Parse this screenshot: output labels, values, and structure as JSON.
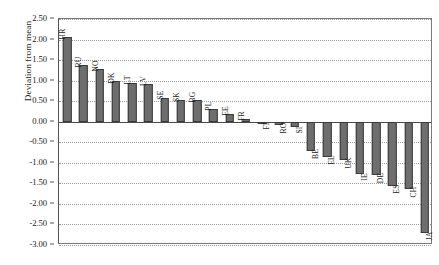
{
  "chart_data": {
    "type": "bar",
    "title": "",
    "xlabel": "",
    "ylabel": "Deviation from mean",
    "ylim": [
      -3.0,
      2.5
    ],
    "grid": true,
    "legend": "none",
    "orientation": "vertical",
    "bar_color": "#6e6e6e",
    "bar_edge_color": "#3a3a3a",
    "y_ticks": [
      "2.50",
      "2.00",
      "1.50",
      "1.00",
      "0.50",
      "0.00",
      "-0.50",
      "-1.00",
      "-1.50",
      "-2.00",
      "-2.50",
      "-3.00"
    ],
    "y_tick_values": [
      2.5,
      2.0,
      1.5,
      1.0,
      0.5,
      0.0,
      -0.5,
      -1.0,
      -1.5,
      -2.0,
      -2.5,
      -3.0
    ],
    "categories": [
      "HR",
      "RU",
      "NO",
      "DK",
      "LT",
      "LV",
      "SE",
      "SK",
      "BG",
      "PL",
      "EE",
      "FR",
      "FI",
      "RO",
      "SI",
      "BE",
      "EL",
      "UK",
      "IE",
      "DE",
      "ES",
      "CH",
      "JA"
    ],
    "values": [
      2.07,
      1.37,
      1.28,
      1.0,
      0.95,
      0.92,
      0.58,
      0.53,
      0.52,
      0.32,
      0.2,
      0.06,
      -0.02,
      -0.09,
      -0.12,
      -0.72,
      -0.87,
      -0.93,
      -1.28,
      -1.3,
      -1.57,
      -1.63,
      -2.72
    ]
  }
}
